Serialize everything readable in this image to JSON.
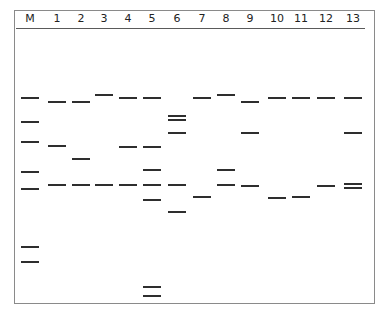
{
  "diagram": {
    "type": "gel-electrophoresis",
    "frame": {
      "left": 14,
      "top": 10,
      "right": 375,
      "bottom": 304
    },
    "band_color": "#2e2e2e",
    "lanes": [
      {
        "label": "M",
        "x": 30,
        "bands": [
          98,
          122,
          142,
          172,
          189,
          247,
          262
        ]
      },
      {
        "label": "1",
        "x": 57,
        "bands": [
          102,
          146,
          185
        ]
      },
      {
        "label": "2",
        "x": 81,
        "bands": [
          102,
          159,
          185
        ]
      },
      {
        "label": "3",
        "x": 104,
        "bands": [
          95,
          185
        ]
      },
      {
        "label": "4",
        "x": 128,
        "bands": [
          98,
          147,
          185
        ]
      },
      {
        "label": "5",
        "x": 152,
        "bands": [
          98,
          147,
          170,
          185,
          200,
          287,
          296
        ]
      },
      {
        "label": "6",
        "x": 177,
        "bands": [
          116,
          120,
          133,
          185,
          212
        ]
      },
      {
        "label": "7",
        "x": 202,
        "bands": [
          98,
          197
        ]
      },
      {
        "label": "8",
        "x": 226,
        "bands": [
          95,
          170,
          185
        ]
      },
      {
        "label": "9",
        "x": 250,
        "bands": [
          102,
          133,
          186
        ]
      },
      {
        "label": "10",
        "x": 277,
        "bands": [
          98,
          198
        ]
      },
      {
        "label": "11",
        "x": 301,
        "bands": [
          98,
          197
        ]
      },
      {
        "label": "12",
        "x": 326,
        "bands": [
          98,
          186
        ]
      },
      {
        "label": "13",
        "x": 353,
        "bands": [
          98,
          133,
          184,
          188
        ]
      }
    ]
  }
}
